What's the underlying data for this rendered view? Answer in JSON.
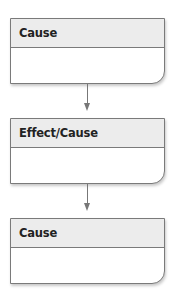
{
  "diagram": {
    "type": "flowchart",
    "boxes": [
      {
        "title": "Cause",
        "body": ""
      },
      {
        "title": "Effect/Cause",
        "body": ""
      },
      {
        "title": "Cause",
        "body": ""
      }
    ],
    "connectors": [
      {
        "from": 0,
        "to": 1,
        "style": "arrow-down"
      },
      {
        "from": 1,
        "to": 2,
        "style": "arrow-down"
      }
    ],
    "colors": {
      "header_fill": "#ececec",
      "border": "#7a7a7a",
      "arrow": "#777777"
    }
  }
}
